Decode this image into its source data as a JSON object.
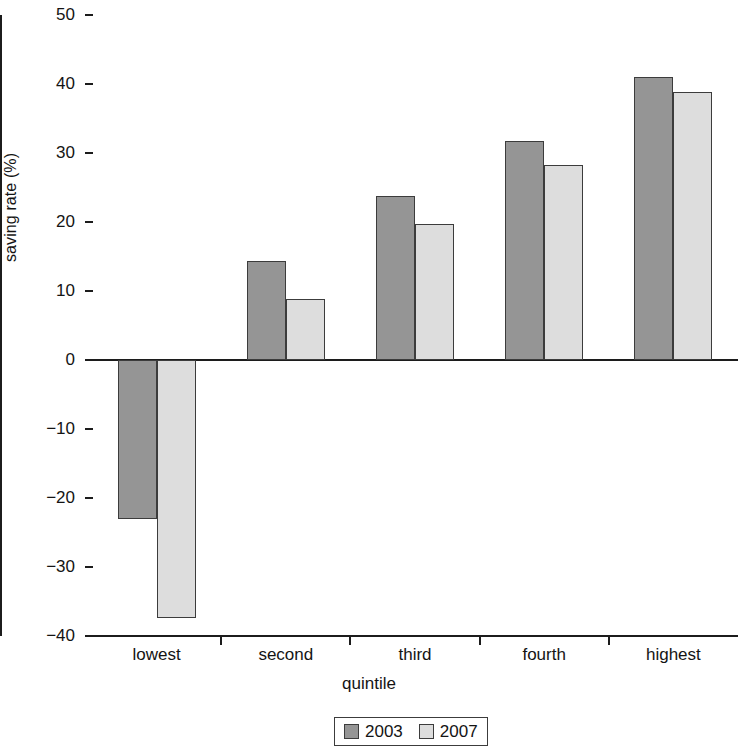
{
  "chart_data": {
    "type": "bar",
    "title": "",
    "xlabel": "quintile",
    "ylabel": "saving rate (%)",
    "categories": [
      "lowest",
      "second",
      "third",
      "fourth",
      "highest"
    ],
    "series": [
      {
        "name": "2003",
        "color": "#959595",
        "values": [
          -23.0,
          14.3,
          23.8,
          31.8,
          41.0
        ]
      },
      {
        "name": "2007",
        "color": "#dddddd",
        "values": [
          -37.4,
          8.8,
          19.7,
          28.2,
          38.8
        ]
      }
    ],
    "ylim": [
      -40,
      50
    ],
    "yticks": [
      50,
      40,
      30,
      20,
      10,
      0,
      -10,
      -20,
      -30,
      -40
    ],
    "ytick_labels": [
      "50",
      "40",
      "30",
      "20",
      "10",
      "0",
      "−10",
      "−20",
      "−30",
      "−40"
    ],
    "grid": false,
    "legend_position": "bottom-center",
    "legend_entries": [
      "2003",
      "2007"
    ]
  }
}
